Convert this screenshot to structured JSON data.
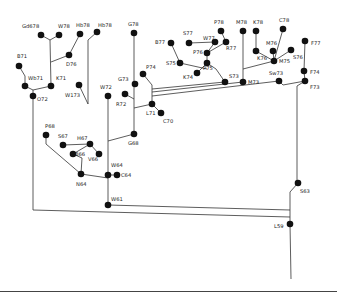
{
  "diagram": {
    "type": "phylogenetic-tree",
    "nodes": [
      {
        "id": "Gd78",
        "label": "Gd678",
        "x": 41,
        "y": 35,
        "lx": 22,
        "ly": 28
      },
      {
        "id": "W78",
        "label": "W78",
        "x": 59,
        "y": 35,
        "lx": 58,
        "ly": 28
      },
      {
        "id": "Hb78a",
        "label": "Hb78",
        "x": 80,
        "y": 34,
        "lx": 76,
        "ly": 27
      },
      {
        "id": "Hb78b",
        "label": "Hb78",
        "x": 97,
        "y": 32,
        "lx": 98,
        "ly": 27
      },
      {
        "id": "D76",
        "label": "D76",
        "x": 69,
        "y": 55,
        "lx": 66,
        "ly": 66
      },
      {
        "id": "B71",
        "label": "B71",
        "x": 19,
        "y": 66,
        "lx": 17,
        "ly": 58
      },
      {
        "id": "Wb71",
        "label": "Wb71",
        "x": 25,
        "y": 86,
        "lx": 28,
        "ly": 80
      },
      {
        "id": "K71",
        "label": "K71",
        "x": 51,
        "y": 86,
        "lx": 56,
        "ly": 80
      },
      {
        "id": "O72",
        "label": "O72",
        "x": 33,
        "y": 96,
        "lx": 37,
        "ly": 101
      },
      {
        "id": "W173",
        "label": "W173",
        "x": 79,
        "y": 85,
        "lx": 65,
        "ly": 97
      },
      {
        "id": "W72",
        "label": "W72",
        "x": 108,
        "y": 96,
        "lx": 100,
        "ly": 89
      },
      {
        "id": "G78",
        "label": "G78",
        "x": 134,
        "y": 33,
        "lx": 128,
        "ly": 26
      },
      {
        "id": "G73",
        "label": "G73",
        "x": 135,
        "y": 84,
        "lx": 118,
        "ly": 81
      },
      {
        "id": "P74",
        "label": "P74",
        "x": 143,
        "y": 74,
        "lx": 146,
        "ly": 69
      },
      {
        "id": "R72",
        "label": "R72",
        "x": 125,
        "y": 94,
        "lx": 116,
        "ly": 106
      },
      {
        "id": "L71",
        "label": "L71",
        "x": 152,
        "y": 104,
        "lx": 146,
        "ly": 115
      },
      {
        "id": "C70",
        "label": "C70",
        "x": 161,
        "y": 113,
        "lx": 163,
        "ly": 123
      },
      {
        "id": "G68",
        "label": "G68",
        "x": 134,
        "y": 134,
        "lx": 128,
        "ly": 145
      },
      {
        "id": "B77",
        "label": "B77",
        "x": 171,
        "y": 43,
        "lx": 155,
        "ly": 44
      },
      {
        "id": "S77",
        "label": "S77",
        "x": 189,
        "y": 43,
        "lx": 183,
        "ly": 35
      },
      {
        "id": "W77",
        "label": "W77",
        "x": 215,
        "y": 42,
        "lx": 203,
        "ly": 40
      },
      {
        "id": "P78",
        "label": "P78",
        "x": 221,
        "y": 31,
        "lx": 214,
        "ly": 24
      },
      {
        "id": "R77",
        "label": "R77",
        "x": 226,
        "y": 42,
        "lx": 226,
        "ly": 50
      },
      {
        "id": "P76",
        "label": "P76",
        "x": 207,
        "y": 53,
        "lx": 193,
        "ly": 54
      },
      {
        "id": "S75",
        "label": "S75",
        "x": 180,
        "y": 63,
        "lx": 166,
        "ly": 65
      },
      {
        "id": "P75",
        "label": "P75",
        "x": 207,
        "y": 63,
        "lx": 203,
        "ly": 70
      },
      {
        "id": "K74",
        "label": "K74",
        "x": 197,
        "y": 73,
        "lx": 183,
        "ly": 79
      },
      {
        "id": "S73",
        "label": "S73",
        "x": 225,
        "y": 82,
        "lx": 229,
        "ly": 78
      },
      {
        "id": "M78",
        "label": "M78",
        "x": 243,
        "y": 31,
        "lx": 236,
        "ly": 24
      },
      {
        "id": "K78",
        "label": "K78",
        "x": 256,
        "y": 31,
        "lx": 253,
        "ly": 24
      },
      {
        "id": "C78",
        "label": "C78",
        "x": 283,
        "y": 29,
        "lx": 279,
        "ly": 22
      },
      {
        "id": "M76",
        "label": "M76",
        "x": 273,
        "y": 51,
        "lx": 266,
        "ly": 45
      },
      {
        "id": "K76",
        "label": "K76",
        "x": 256,
        "y": 51,
        "lx": 257,
        "ly": 60
      },
      {
        "id": "S76",
        "label": "S76",
        "x": 291,
        "y": 50,
        "lx": 293,
        "ly": 59
      },
      {
        "id": "M75",
        "label": "M75",
        "x": 274,
        "y": 61,
        "lx": 279,
        "ly": 63
      },
      {
        "id": "M73",
        "label": "M73",
        "x": 243,
        "y": 82,
        "lx": 248,
        "ly": 84
      },
      {
        "id": "Sw73",
        "label": "Sw73",
        "x": 279,
        "y": 81,
        "lx": 269,
        "ly": 75
      },
      {
        "id": "F77",
        "label": "F77",
        "x": 305,
        "y": 41,
        "lx": 311,
        "ly": 45
      },
      {
        "id": "F74",
        "label": "F74",
        "x": 304,
        "y": 71,
        "lx": 310,
        "ly": 74
      },
      {
        "id": "F73",
        "label": "F73",
        "x": 305,
        "y": 81,
        "lx": 310,
        "ly": 89
      },
      {
        "id": "P68",
        "label": "P68",
        "x": 46,
        "y": 135,
        "lx": 45,
        "ly": 128
      },
      {
        "id": "S67",
        "label": "S67",
        "x": 63,
        "y": 145,
        "lx": 58,
        "ly": 138
      },
      {
        "id": "H67",
        "label": "H67",
        "x": 90,
        "y": 144,
        "lx": 77,
        "ly": 140
      },
      {
        "id": "B66",
        "label": "B66",
        "x": 73,
        "y": 154,
        "lx": 75,
        "ly": 156
      },
      {
        "id": "V66",
        "label": "V66",
        "x": 99,
        "y": 154,
        "lx": 88,
        "ly": 161
      },
      {
        "id": "N64",
        "label": "N64",
        "x": 81,
        "y": 174,
        "lx": 76,
        "ly": 186
      },
      {
        "id": "W64",
        "label": "W64",
        "x": 108,
        "y": 175,
        "lx": 111,
        "ly": 167
      },
      {
        "id": "C64",
        "label": "C64",
        "x": 117,
        "y": 175,
        "lx": 121,
        "ly": 177
      },
      {
        "id": "W61",
        "label": "W61",
        "x": 108,
        "y": 205,
        "lx": 111,
        "ly": 201
      },
      {
        "id": "S63",
        "label": "S63",
        "x": 298,
        "y": 183,
        "lx": 300,
        "ly": 193
      },
      {
        "id": "L59",
        "label": "L59",
        "x": 290,
        "y": 224,
        "lx": 274,
        "ly": 228
      }
    ],
    "edges": [
      [
        [
          41,
          35
        ],
        [
          50,
          40
        ],
        [
          59,
          35
        ]
      ],
      [
        [
          50,
          40
        ],
        [
          51,
          86
        ]
      ],
      [
        [
          69,
          55
        ],
        [
          51,
          62
        ]
      ],
      [
        [
          80,
          34
        ],
        [
          69,
          55
        ]
      ],
      [
        [
          97,
          32
        ],
        [
          88,
          40
        ],
        [
          88,
          104
        ]
      ],
      [
        [
          19,
          66
        ],
        [
          25,
          76
        ],
        [
          25,
          86
        ]
      ],
      [
        [
          25,
          86
        ],
        [
          33,
          90
        ],
        [
          51,
          86
        ]
      ],
      [
        [
          33,
          90
        ],
        [
          33,
          210
        ]
      ],
      [
        [
          79,
          85
        ],
        [
          88,
          104
        ]
      ],
      [
        [
          108,
          96
        ],
        [
          108,
          205
        ]
      ],
      [
        [
          134,
          33
        ],
        [
          134,
          134
        ]
      ],
      [
        [
          143,
          74
        ],
        [
          152,
          85
        ],
        [
          152,
          104
        ]
      ],
      [
        [
          125,
          94
        ],
        [
          134,
          99
        ]
      ],
      [
        [
          134,
          108
        ],
        [
          152,
          104
        ]
      ],
      [
        [
          152,
          104
        ],
        [
          161,
          113
        ]
      ],
      [
        [
          134,
          134
        ],
        [
          108,
          141
        ]
      ],
      [
        [
          152,
          89
        ],
        [
          225,
          82
        ]
      ],
      [
        [
          152,
          92
        ],
        [
          243,
          82
        ]
      ],
      [
        [
          152,
          96
        ],
        [
          279,
          81
        ],
        [
          283,
          85
        ],
        [
          305,
          81
        ]
      ],
      [
        [
          171,
          43
        ],
        [
          180,
          63
        ]
      ],
      [
        [
          180,
          63
        ],
        [
          207,
          69
        ]
      ],
      [
        [
          189,
          43
        ],
        [
          215,
          42
        ]
      ],
      [
        [
          221,
          31
        ],
        [
          226,
          42
        ]
      ],
      [
        [
          215,
          42
        ],
        [
          207,
          53
        ]
      ],
      [
        [
          226,
          42
        ],
        [
          207,
          53
        ]
      ],
      [
        [
          207,
          53
        ],
        [
          207,
          63
        ]
      ],
      [
        [
          207,
          63
        ],
        [
          197,
          73
        ]
      ],
      [
        [
          207,
          63
        ],
        [
          216,
          69
        ],
        [
          225,
          82
        ]
      ],
      [
        [
          243,
          31
        ],
        [
          243,
          82
        ]
      ],
      [
        [
          256,
          31
        ],
        [
          256,
          51
        ],
        [
          274,
          61
        ]
      ],
      [
        [
          283,
          29
        ],
        [
          274,
          61
        ]
      ],
      [
        [
          273,
          51
        ],
        [
          274,
          61
        ]
      ],
      [
        [
          291,
          50
        ],
        [
          274,
          61
        ]
      ],
      [
        [
          243,
          69
        ],
        [
          274,
          61
        ]
      ],
      [
        [
          305,
          41
        ],
        [
          304,
          71
        ]
      ],
      [
        [
          304,
          71
        ],
        [
          305,
          81
        ]
      ],
      [
        [
          305,
          81
        ],
        [
          297,
          86
        ],
        [
          297,
          183
        ]
      ],
      [
        [
          298,
          183
        ],
        [
          290,
          192
        ],
        [
          290,
          224
        ]
      ],
      [
        [
          46,
          135
        ],
        [
          46,
          144
        ],
        [
          81,
          174
        ]
      ],
      [
        [
          63,
          145
        ],
        [
          90,
          144
        ]
      ],
      [
        [
          90,
          144
        ],
        [
          73,
          154
        ]
      ],
      [
        [
          90,
          144
        ],
        [
          99,
          154
        ]
      ],
      [
        [
          73,
          154
        ],
        [
          82,
          158
        ],
        [
          81,
          174
        ]
      ],
      [
        [
          81,
          174
        ],
        [
          108,
          178
        ]
      ],
      [
        [
          108,
          175
        ],
        [
          117,
          175
        ]
      ],
      [
        [
          108,
          205
        ],
        [
          290,
          210
        ]
      ],
      [
        [
          33,
          210
        ],
        [
          290,
          217
        ]
      ],
      [
        [
          290,
          224
        ],
        [
          291,
          279
        ]
      ]
    ]
  }
}
